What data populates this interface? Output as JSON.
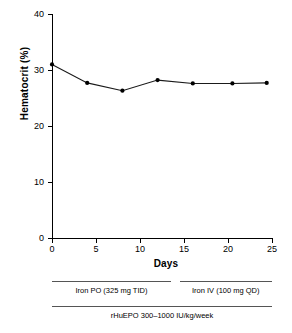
{
  "chart_data": {
    "type": "line",
    "title": "",
    "xlabel": "Days",
    "ylabel": "Hematocrit (%)",
    "xlim": [
      0,
      25
    ],
    "ylim": [
      0,
      40
    ],
    "grid": false,
    "legend": "none",
    "x_ticks": [
      "0",
      "5",
      "10",
      "15",
      "20",
      "25"
    ],
    "x_tick_values": [
      0,
      5,
      10,
      15,
      20,
      25
    ],
    "y_ticks": [
      "0",
      "10",
      "20",
      "30",
      "40"
    ],
    "y_tick_values": [
      0,
      10,
      20,
      30,
      40
    ],
    "marker": "filled-circle",
    "series": [
      {
        "name": "Hematocrit",
        "x": [
          0,
          4,
          8,
          12,
          16,
          20.5,
          24.4
        ],
        "values": [
          31.0,
          27.7,
          26.3,
          28.2,
          27.6,
          27.6,
          27.7
        ]
      }
    ],
    "annotations": [
      {
        "name": "iron-po-bar",
        "label": "Iron PO (325 mg TID)",
        "x_start": 0,
        "x_end": 13.5
      },
      {
        "name": "iron-iv-bar",
        "label": "Iron IV (100 mg QD)",
        "x_start": 14.5,
        "x_end": 25
      },
      {
        "name": "rhuepo-bar",
        "label": "rHuEPO 300–1000 IU/kg/week",
        "x_start": 0,
        "x_end": 25
      }
    ],
    "colors": {
      "line": "#1a1a1a",
      "marker": "#000000",
      "axis": "#000000",
      "annotation_rule": "#555555",
      "background": "#ffffff"
    }
  }
}
